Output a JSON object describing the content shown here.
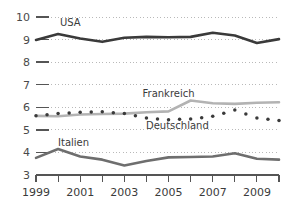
{
  "chart_data": {
    "type": "line",
    "title": "",
    "subtitle": "",
    "xlabel": "",
    "ylabel": "",
    "xlim": [
      1999,
      2010
    ],
    "ylim": [
      3,
      10
    ],
    "grid": true,
    "grid_style": "dotted-horizontal",
    "legend_position": "inline-annotations",
    "x": [
      1999,
      2000,
      2001,
      2002,
      2003,
      2004,
      2005,
      2006,
      2007,
      2008,
      2009,
      2010
    ],
    "y_ticks": [
      3,
      4,
      5,
      6,
      7,
      8,
      9,
      10
    ],
    "y_tick_labels": [
      "3",
      "4",
      "5",
      "6",
      "7",
      "8",
      "9",
      "10"
    ],
    "x_ticks": [
      1999,
      2000,
      2001,
      2002,
      2003,
      2004,
      2005,
      2006,
      2007,
      2008,
      2009,
      2010
    ],
    "x_tick_labels": [
      "1999",
      "",
      "2001",
      "",
      "2003",
      "",
      "2005",
      "",
      "2007",
      "",
      "2009",
      ""
    ],
    "x_labels_shown": [
      "1999",
      "2001",
      "2003",
      "2005",
      "2007",
      "2009"
    ],
    "series": [
      {
        "name": "USA",
        "style": "solid",
        "color": "#3a3a3a",
        "width": 2.6,
        "label_x": 2000.55,
        "label_y": 9.62,
        "values": [
          8.98,
          9.25,
          9.05,
          8.9,
          9.08,
          9.12,
          9.1,
          9.12,
          9.3,
          9.18,
          8.85,
          9.02
        ]
      },
      {
        "name": "Frankreich",
        "style": "solid",
        "color": "#b3b3b3",
        "width": 2.6,
        "label_x": 2005.0,
        "label_y": 6.45,
        "values": [
          5.62,
          5.6,
          5.68,
          5.7,
          5.72,
          5.78,
          5.82,
          6.3,
          6.18,
          6.15,
          6.2,
          6.22
        ]
      },
      {
        "name": "Deutschland",
        "style": "dotted",
        "color": "#3a3a3a",
        "width": 2.6,
        "label_x": 2005.4,
        "label_y": 5.05,
        "values": [
          5.62,
          5.72,
          5.78,
          5.8,
          5.72,
          5.52,
          5.45,
          5.48,
          5.6,
          5.88,
          5.52,
          5.42
        ]
      },
      {
        "name": "Italien",
        "style": "solid",
        "color": "#6e6e6e",
        "width": 2.6,
        "label_x": 2000.7,
        "label_y": 4.28,
        "values": [
          3.76,
          4.15,
          3.82,
          3.68,
          3.42,
          3.62,
          3.78,
          3.8,
          3.82,
          3.96,
          3.72,
          3.68
        ]
      }
    ],
    "colors": {
      "usa": "#3a3a3a",
      "frankreich": "#b3b3b3",
      "deutschland": "#3a3a3a",
      "italien": "#6e6e6e",
      "axis": "#555555",
      "grid": "#b9b9b9",
      "text": "#3b3b3b",
      "background": "#ffffff"
    }
  }
}
